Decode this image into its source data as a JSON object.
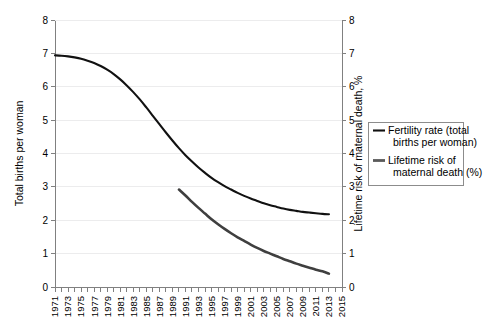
{
  "chart_data": {
    "type": "line",
    "title": "",
    "xlabel": "",
    "ylabel": "Total births per woman",
    "y2label": "Lifetime risk of maternal death, %",
    "grid": true,
    "legend_position": "right",
    "xlim": [
      1971,
      2015
    ],
    "ylim": [
      0,
      8
    ],
    "y2lim": [
      0,
      8
    ],
    "yticks": [
      0,
      1,
      2,
      3,
      4,
      5,
      6,
      7,
      8
    ],
    "y2ticks": [
      0,
      1,
      2,
      3,
      4,
      5,
      6,
      7,
      8
    ],
    "ytick_labels": [
      "0",
      "1",
      "2",
      "3",
      "4",
      "5",
      "6",
      "7",
      "8"
    ],
    "y2tick_labels": [
      "0",
      "1",
      "2",
      "3",
      "4",
      "5",
      "6",
      "7",
      "8"
    ],
    "xticks": [
      1971,
      1972,
      1973,
      1974,
      1975,
      1976,
      1977,
      1978,
      1979,
      1980,
      1981,
      1982,
      1983,
      1984,
      1985,
      1986,
      1987,
      1988,
      1989,
      1990,
      1991,
      1992,
      1993,
      1994,
      1995,
      1996,
      1997,
      1998,
      1999,
      2000,
      2001,
      2002,
      2003,
      2004,
      2005,
      2006,
      2007,
      2008,
      2009,
      2010,
      2011,
      2012,
      2013,
      2014,
      2015
    ],
    "xtick_labels": [
      "1971",
      "",
      "1973",
      "",
      "1975",
      "",
      "1977",
      "",
      "1979",
      "",
      "1981",
      "",
      "1983",
      "",
      "1985",
      "",
      "1987",
      "",
      "1989",
      "",
      "1991",
      "",
      "1993",
      "",
      "1995",
      "",
      "1997",
      "",
      "1999",
      "",
      "2001",
      "",
      "2003",
      "",
      "2005",
      "",
      "2007",
      "",
      "2009",
      "",
      "2011",
      "",
      "2013",
      "",
      "2015"
    ],
    "series": [
      {
        "name": "Fertility rate (total births per woman)",
        "axis": "left",
        "color": "#111111",
        "width": 2.1,
        "x": [
          1971,
          1972,
          1973,
          1974,
          1975,
          1976,
          1977,
          1978,
          1979,
          1980,
          1981,
          1982,
          1983,
          1984,
          1985,
          1986,
          1987,
          1988,
          1989,
          1990,
          1991,
          1992,
          1993,
          1994,
          1995,
          1996,
          1997,
          1998,
          1999,
          2000,
          2001,
          2002,
          2003,
          2004,
          2005,
          2006,
          2007,
          2008,
          2009,
          2010,
          2011,
          2012,
          2013
        ],
        "values": [
          6.94,
          6.93,
          6.91,
          6.88,
          6.84,
          6.78,
          6.71,
          6.62,
          6.51,
          6.38,
          6.22,
          6.04,
          5.84,
          5.62,
          5.38,
          5.13,
          4.88,
          4.63,
          4.39,
          4.16,
          3.95,
          3.76,
          3.58,
          3.42,
          3.27,
          3.14,
          3.02,
          2.92,
          2.82,
          2.73,
          2.65,
          2.58,
          2.51,
          2.45,
          2.4,
          2.35,
          2.31,
          2.28,
          2.25,
          2.23,
          2.21,
          2.19,
          2.18
        ]
      },
      {
        "name": "Lifetime risk of maternal death (%)",
        "axis": "right",
        "color": "#3f3f3f",
        "width": 2.6,
        "x": [
          1990,
          1991,
          1992,
          1993,
          1994,
          1995,
          1996,
          1997,
          1998,
          1999,
          2000,
          2001,
          2002,
          2003,
          2004,
          2005,
          2006,
          2007,
          2008,
          2009,
          2010,
          2011,
          2012,
          2013
        ],
        "values": [
          2.92,
          2.74,
          2.55,
          2.37,
          2.2,
          2.03,
          1.88,
          1.74,
          1.61,
          1.49,
          1.38,
          1.27,
          1.17,
          1.08,
          1.0,
          0.92,
          0.84,
          0.77,
          0.7,
          0.64,
          0.58,
          0.52,
          0.47,
          0.4
        ]
      }
    ],
    "legend": [
      {
        "label_line1": "Fertility rate (total",
        "label_line2": "births per woman)",
        "color": "#111111",
        "width": 2.1
      },
      {
        "label_line1": "Lifetime risk of",
        "label_line2": "maternal death (%)",
        "color": "#5a5a5a",
        "width": 2.8
      }
    ]
  },
  "layout": {
    "plot_left": 55,
    "plot_right": 342,
    "plot_top": 20,
    "plot_bottom": 287,
    "legend_x": 368,
    "legend_y": 122,
    "legend_w": 95,
    "legend_h": 63
  }
}
